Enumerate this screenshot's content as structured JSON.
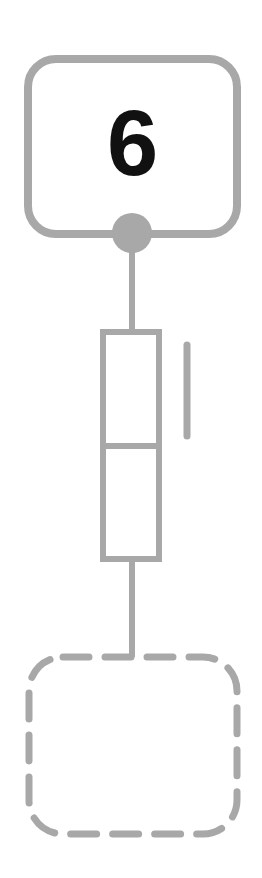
{
  "diagram": {
    "title_label": "6",
    "colors": {
      "stroke": "#a8a8a8",
      "node_fill": "#a8a8a8",
      "text": "#111111",
      "background": "#ffffff"
    },
    "elements": [
      {
        "type": "rounded-box",
        "style": "solid",
        "label": "6"
      },
      {
        "type": "connection-node",
        "shape": "filled-circle"
      },
      {
        "type": "wire"
      },
      {
        "type": "component",
        "shape": "rectangle-split-in-two"
      },
      {
        "type": "indicator-bar",
        "orientation": "vertical"
      },
      {
        "type": "wire"
      },
      {
        "type": "rounded-box",
        "style": "dashed",
        "label": ""
      }
    ]
  }
}
